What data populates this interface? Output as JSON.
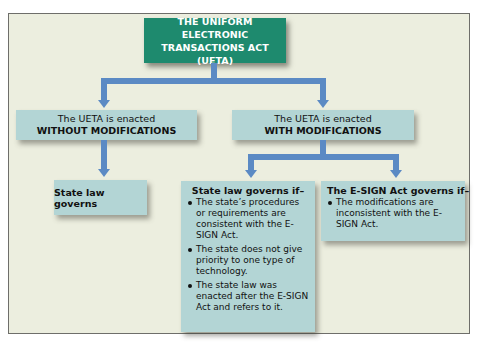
{
  "diagram": {
    "type": "flowchart",
    "root": {
      "line1": "THE UNIFORM ELECTRONIC",
      "line2": "TRANSACTIONS ACT (UETA)"
    },
    "without_modifications": {
      "line1": "The UETA is enacted",
      "line2": "WITHOUT MODIFICATIONS",
      "outcome": "State law governs"
    },
    "with_modifications": {
      "line1": "The UETA is enacted",
      "line2": "WITH MODIFICATIONS",
      "state_law": {
        "heading": "State law governs if–",
        "bullets": [
          "The state’s procedures or requirements are consistent with the E-SIGN Act.",
          "The state does not give priority to one type of technology.",
          "The state law was enacted after the E-SIGN Act and refers to it."
        ]
      },
      "esign": {
        "heading": "The E-SIGN Act governs if–",
        "bullets": [
          "The modifications are inconsistent with the E-SIGN Act."
        ]
      }
    },
    "colors": {
      "root_box": "#1e8a6e",
      "node_box": "#b3d5d5",
      "connector": "#5b8ac4",
      "background": "#eceedf"
    }
  }
}
